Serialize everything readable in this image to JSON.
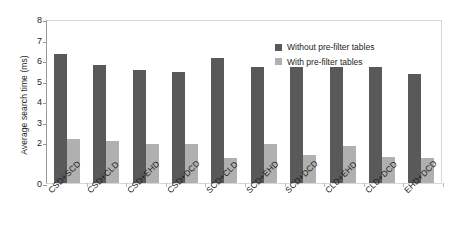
{
  "chart_data": {
    "type": "bar",
    "title": "",
    "xlabel": "",
    "ylabel": "Average search time (ms)",
    "ylim": [
      0,
      8
    ],
    "yticks": [
      0,
      2,
      3,
      4,
      5,
      6,
      7,
      8
    ],
    "ytick_labels": [
      "0",
      "2",
      "3",
      "4",
      "5",
      "6",
      "7",
      "8"
    ],
    "grid": false,
    "legend_position": "upper right inside plot",
    "categories": [
      "CSD+SCD",
      "CSD+CLD",
      "CSD+EHD",
      "CSD+DCD",
      "SCD+CLD",
      "SCD+EHD",
      "SCD+DCD",
      "CLD+EHD",
      "CLD+DCD",
      "EHD+DCD"
    ],
    "series": [
      {
        "name": "Without pre-filter tables",
        "color": "#595959",
        "values": [
          6.3,
          5.75,
          5.5,
          5.4,
          6.1,
          5.65,
          5.65,
          5.65,
          5.65,
          5.3
        ]
      },
      {
        "name": "With pre-filter tables",
        "color": "#b0b0b0",
        "values": [
          2.15,
          2.05,
          1.9,
          1.9,
          1.2,
          1.9,
          1.35,
          1.8,
          1.25,
          1.2
        ]
      }
    ]
  },
  "axes": {
    "y_title": "Average search time (ms)"
  },
  "legend": {
    "items": [
      {
        "label": "Without pre-filter tables",
        "color": "#595959"
      },
      {
        "label": "With pre-filter tables",
        "color": "#b0b0b0"
      }
    ]
  },
  "colors": {
    "series_without": "#595959",
    "series_with": "#b0b0b0",
    "axis": "#9a9a9a",
    "frame": "#d8d8d8",
    "text": "#231f20",
    "background": "#ffffff"
  }
}
